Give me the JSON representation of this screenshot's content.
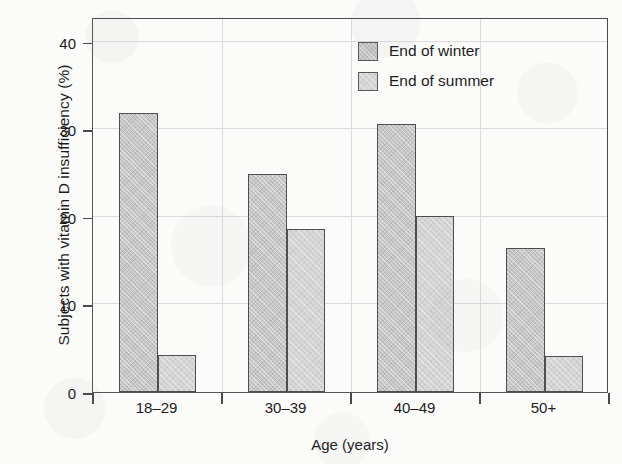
{
  "chart_data": {
    "type": "bar",
    "title": "",
    "xlabel": "Age (years)",
    "ylabel": "Subjects with vitamin D insufficiency (%)",
    "categories": [
      "18–29",
      "30–39",
      "40–49",
      "50+"
    ],
    "series": [
      {
        "name": "End of winter",
        "values": [
          31.9,
          24.9,
          30.6,
          16.4
        ],
        "color": "#c6c6c6"
      },
      {
        "name": "End of summer",
        "values": [
          4.2,
          18.6,
          20.1,
          4.1
        ],
        "color": "#d4d4d4"
      }
    ],
    "ylim": [
      0,
      42.8
    ],
    "yticks": [
      0,
      10,
      20,
      30,
      40
    ],
    "ytick_labels": [
      "0",
      "10",
      "20",
      "30",
      "40"
    ],
    "grid": true,
    "legend_position": "upper right"
  },
  "legend": {
    "items": [
      {
        "label": "End of winter"
      },
      {
        "label": "End of summer"
      }
    ]
  }
}
